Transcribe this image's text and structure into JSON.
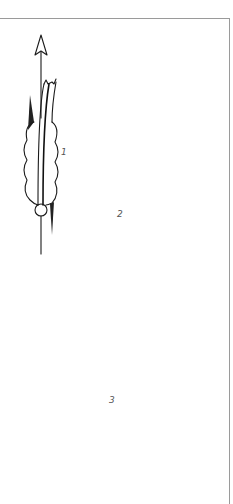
{
  "figure": {
    "colors": {
      "ink": "#1a1a1a",
      "path_dashed": "#8a8a8a",
      "frame": "#9a9a9a",
      "label": "#555555"
    },
    "panels": [
      {
        "label": "1",
        "motion": "straight-up",
        "path": "solid-arrow"
      },
      {
        "label": "2",
        "motion": "curving-left",
        "path": "dashed-curve-with-arrow"
      },
      {
        "label": "3",
        "motion": "curving-right",
        "path": "dashed-curve-with-arrow"
      }
    ]
  }
}
